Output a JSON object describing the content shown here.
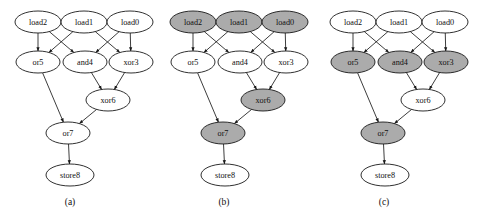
{
  "figure": {
    "background": "#ffffff",
    "shade_color": "#ababab",
    "plain_color": "#ffffff",
    "stroke_color": "#1a1a1a",
    "width": 481,
    "height": 219
  },
  "node_layout": [
    {
      "id": "load2",
      "label": "load2",
      "cx": 38,
      "cy": 22,
      "rx": 23,
      "ry": 11
    },
    {
      "id": "load1",
      "label": "load1",
      "cx": 84,
      "cy": 22,
      "rx": 23,
      "ry": 11
    },
    {
      "id": "load0",
      "label": "load0",
      "cx": 130,
      "cy": 22,
      "rx": 23,
      "ry": 11
    },
    {
      "id": "or5",
      "label": "or5",
      "cx": 38,
      "cy": 62,
      "rx": 22,
      "ry": 11
    },
    {
      "id": "and4",
      "label": "and4",
      "cx": 85,
      "cy": 62,
      "rx": 22,
      "ry": 11
    },
    {
      "id": "xor3",
      "label": "xor3",
      "cx": 131,
      "cy": 62,
      "rx": 22,
      "ry": 11
    },
    {
      "id": "xor6",
      "label": "xor6",
      "cx": 108,
      "cy": 100,
      "rx": 22,
      "ry": 11
    },
    {
      "id": "or7",
      "label": "or7",
      "cx": 68,
      "cy": 133,
      "rx": 22,
      "ry": 11
    },
    {
      "id": "store8",
      "label": "store8",
      "cx": 70,
      "cy": 175,
      "rx": 24,
      "ry": 11
    }
  ],
  "edges": [
    {
      "from": "load2",
      "to": "or5"
    },
    {
      "from": "load2",
      "to": "and4"
    },
    {
      "from": "load1",
      "to": "or5"
    },
    {
      "from": "load1",
      "to": "xor3"
    },
    {
      "from": "load0",
      "to": "and4"
    },
    {
      "from": "load0",
      "to": "xor3"
    },
    {
      "from": "and4",
      "to": "xor6"
    },
    {
      "from": "xor3",
      "to": "xor6"
    },
    {
      "from": "or5",
      "to": "or7"
    },
    {
      "from": "xor6",
      "to": "or7"
    },
    {
      "from": "or7",
      "to": "store8"
    }
  ],
  "panels": [
    {
      "id": "a",
      "caption": "(a)",
      "offset_x": 0,
      "caption_x": 70,
      "caption_y": 205,
      "shaded_nodes": []
    },
    {
      "id": "b",
      "caption": "(b)",
      "offset_x": 155,
      "caption_x": 69,
      "caption_y": 205,
      "shaded_nodes": [
        "load2",
        "load1",
        "load0",
        "xor6",
        "or7"
      ]
    },
    {
      "id": "c",
      "caption": "(c)",
      "offset_x": 315,
      "caption_x": 69,
      "caption_y": 205,
      "shaded_nodes": [
        "or5",
        "and4",
        "xor3",
        "or7"
      ]
    }
  ]
}
